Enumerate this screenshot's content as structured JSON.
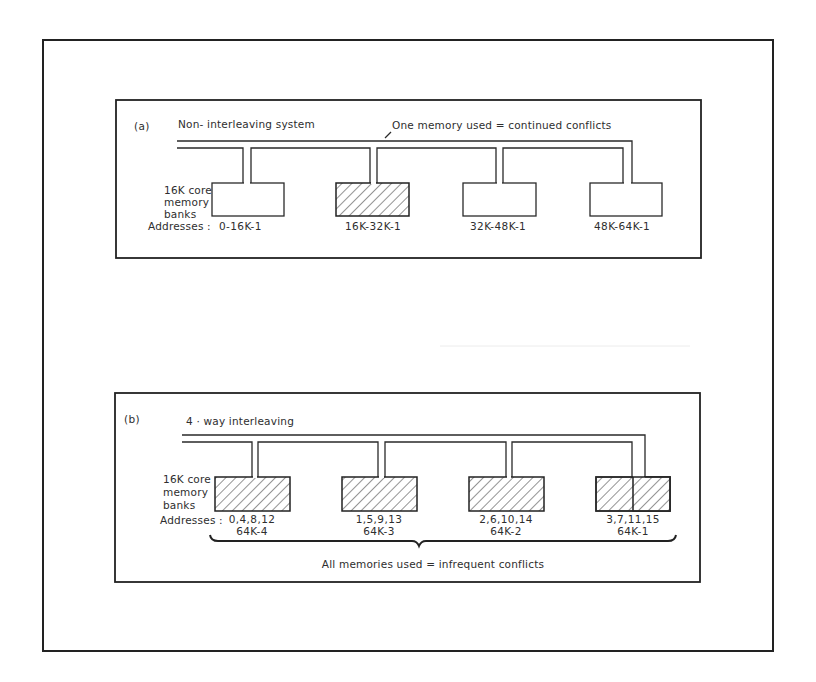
{
  "figure": {
    "panel_a": {
      "label": "(a)",
      "title": "Non- interleaving system",
      "annotation": "One memory used = continued conflicts",
      "bank_caption_lines": [
        "16K core",
        "memory",
        "banks"
      ],
      "addresses_label": "Addresses :",
      "banks": [
        {
          "address": "0-16K-1",
          "hatched": false
        },
        {
          "address": "16K-32K-1",
          "hatched": true
        },
        {
          "address": "32K-48K-1",
          "hatched": false
        },
        {
          "address": "48K-64K-1",
          "hatched": false
        }
      ]
    },
    "panel_b": {
      "label": "(b)",
      "title": "4 · way interleaving",
      "annotation": "All memories used = infrequent conflicts",
      "bank_caption_lines": [
        "16K core",
        "memory",
        "banks"
      ],
      "addresses_label": "Addresses :",
      "banks": [
        {
          "address_line1": "0,4,8,12",
          "address_line2": "64K-4",
          "hatched": true
        },
        {
          "address_line1": "1,5,9,13",
          "address_line2": "64K-3",
          "hatched": true
        },
        {
          "address_line1": "2,6,10,14",
          "address_line2": "64K-2",
          "hatched": true
        },
        {
          "address_line1": "3,7,11,15",
          "address_line2": "64K-1",
          "hatched": true
        }
      ]
    },
    "colors": {
      "ink": "#2a2a2a",
      "background": "#ffffff"
    }
  }
}
